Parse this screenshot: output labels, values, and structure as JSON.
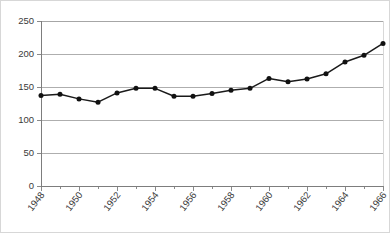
{
  "chart_data": {
    "type": "line",
    "title": "",
    "subtitle": "",
    "xlabel": "",
    "ylabel": "",
    "ylim": [
      0,
      250
    ],
    "ytick_step": 50,
    "yticks": [
      "0",
      "50",
      "100",
      "150",
      "200",
      "250"
    ],
    "xlim": [
      1948,
      1966
    ],
    "xticks_major": [
      "1948",
      "1950",
      "1952",
      "1954",
      "1956",
      "1958",
      "1960",
      "1962",
      "1964",
      "1966"
    ],
    "xtick_minor_step": 1,
    "grid": "horizontal",
    "legend": "none",
    "x": [
      1948,
      1949,
      1950,
      1951,
      1952,
      1953,
      1954,
      1955,
      1956,
      1957,
      1958,
      1959,
      1960,
      1961,
      1962,
      1963,
      1964,
      1965,
      1966
    ],
    "values": [
      137,
      139,
      132,
      127,
      141,
      148,
      148,
      136,
      136,
      140,
      145,
      148,
      163,
      158,
      162,
      170,
      188,
      198,
      216
    ],
    "series": [
      {
        "name": "series-1",
        "marker": "circle",
        "color": "#111111",
        "values": [
          137,
          139,
          132,
          127,
          141,
          148,
          148,
          136,
          136,
          140,
          145,
          148,
          163,
          158,
          162,
          170,
          188,
          198,
          216
        ]
      }
    ],
    "point_labels": [
      "1948: 137",
      "1949: 139",
      "1950: 132",
      "1951: 127",
      "1952: 141",
      "1953: 148",
      "1954: 148",
      "1955: 136",
      "1956: 136",
      "1957: 140",
      "1958: 145",
      "1959: 148",
      "1960: 163",
      "1961: 158",
      "1962: 162",
      "1963: 170",
      "1964: 188",
      "1965: 198",
      "1966: 216"
    ],
    "colors": {
      "line": "#1a1a1a",
      "marker": "#111111",
      "grid": "#9a9a9a",
      "axis": "#7d7d7d",
      "text": "#3a3a3a",
      "plot_background": "#ffffff",
      "frame": "#c8c8c8"
    }
  }
}
